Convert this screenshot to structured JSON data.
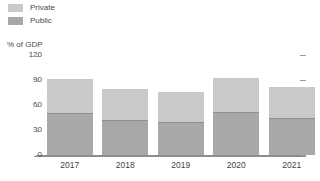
{
  "legend": {
    "position": "top-left",
    "items": [
      {
        "label": "Private",
        "color": "#c9c9c9",
        "name": "legend-item-private"
      },
      {
        "label": "Public",
        "color": "#a8a8a8",
        "name": "legend-item-public"
      }
    ]
  },
  "axis_title": "% of GDP",
  "colors": {
    "private": "#c9c9c9",
    "public": "#a8a8a8",
    "axis": "#8c8c8c",
    "tick_text": "#4a4a4a",
    "background": "#ffffff"
  },
  "chart_data": {
    "type": "bar",
    "stacked": true,
    "title": "",
    "subtitle": "",
    "xlabel": "",
    "ylabel": "% of GDP",
    "categories": [
      "2017",
      "2018",
      "2019",
      "2020",
      "2021"
    ],
    "yticks": [
      "120",
      "90",
      "60",
      "30",
      "0"
    ],
    "ytick_values": [
      120,
      90,
      60,
      30,
      0
    ],
    "ylim": [
      0,
      120
    ],
    "grid": false,
    "legend_position": "top-left",
    "series": [
      {
        "name": "Public",
        "values": [
          50,
          42,
          40,
          52,
          44
        ]
      },
      {
        "name": "Private",
        "values": [
          41,
          37,
          36,
          41,
          38
        ]
      }
    ],
    "totals": [
      91,
      79,
      76,
      93,
      82
    ]
  }
}
